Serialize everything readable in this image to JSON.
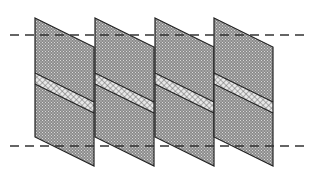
{
  "diagram": {
    "colors": {
      "background": "#ffffff",
      "panel_fill": "#8c8c8c",
      "panel_dots": "#d8d8d8",
      "stripe_fill": "#e8e8e8",
      "stripe_cross": "#6a6a6a",
      "outline": "#222222",
      "dash": "#333333"
    },
    "dashed_lines": [
      {
        "name": "upper-dashed-line",
        "y": 35,
        "x1": 10,
        "x2": 305
      },
      {
        "name": "lower-dashed-line",
        "y": 146,
        "x1": 10,
        "x2": 305
      }
    ],
    "panels": [
      {
        "name": "panel-1",
        "x": 35
      },
      {
        "name": "panel-2",
        "x": 95
      },
      {
        "name": "panel-3",
        "x": 155
      },
      {
        "name": "panel-4",
        "x": 214
      }
    ],
    "panel_geometry": {
      "width": 59,
      "top_left_y": 18,
      "top_right_y": 47,
      "bottom_left_y": 137,
      "bottom_right_y": 166,
      "stripe_top_left_y": 73,
      "stripe_bottom_left_y": 84
    }
  }
}
